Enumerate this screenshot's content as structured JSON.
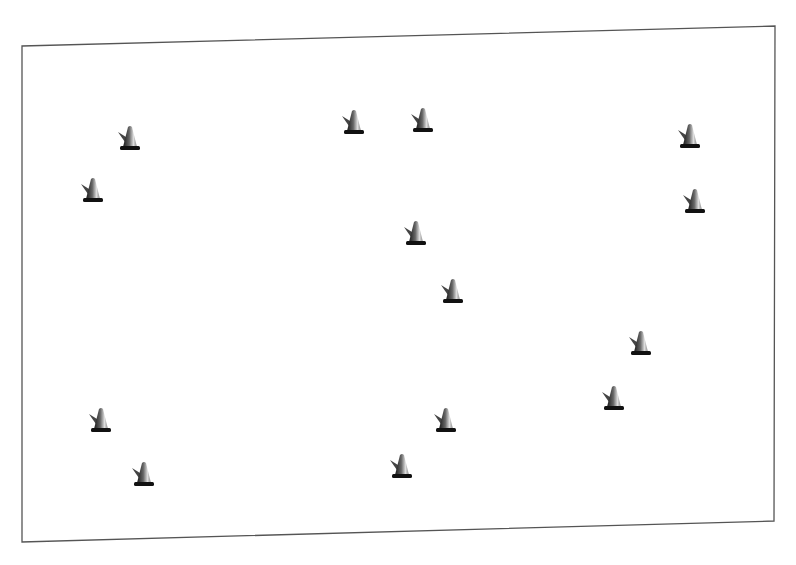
{
  "diagram": {
    "type": "cone-layout",
    "field": {
      "corners": [
        [
          22,
          46
        ],
        [
          775,
          26
        ],
        [
          774,
          521
        ],
        [
          22,
          542
        ]
      ],
      "border_color": "#555555",
      "background": "#ffffff"
    },
    "cone_count": 14,
    "cones": [
      {
        "id": 1,
        "x": 130,
        "y": 140
      },
      {
        "id": 2,
        "x": 93,
        "y": 192
      },
      {
        "id": 3,
        "x": 354,
        "y": 124
      },
      {
        "id": 4,
        "x": 423,
        "y": 122
      },
      {
        "id": 5,
        "x": 690,
        "y": 138
      },
      {
        "id": 6,
        "x": 695,
        "y": 203
      },
      {
        "id": 7,
        "x": 416,
        "y": 235
      },
      {
        "id": 8,
        "x": 453,
        "y": 293
      },
      {
        "id": 9,
        "x": 641,
        "y": 345
      },
      {
        "id": 10,
        "x": 614,
        "y": 400
      },
      {
        "id": 11,
        "x": 101,
        "y": 422
      },
      {
        "id": 12,
        "x": 144,
        "y": 476
      },
      {
        "id": 13,
        "x": 446,
        "y": 422
      },
      {
        "id": 14,
        "x": 402,
        "y": 468
      }
    ],
    "icon": "traffic-cone-icon"
  }
}
